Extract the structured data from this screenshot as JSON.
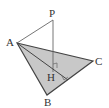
{
  "diagram": {
    "type": "geometry-pyramid",
    "points": {
      "P": {
        "label": "P",
        "x": 53,
        "y": 20
      },
      "A": {
        "label": "A",
        "x": 17,
        "y": 43
      },
      "B": {
        "label": "B",
        "x": 47,
        "y": 95
      },
      "C": {
        "label": "C",
        "x": 93,
        "y": 61
      },
      "H": {
        "label": "H",
        "x": 53,
        "y": 72
      },
      "D": {
        "x": 68,
        "y": 80
      }
    },
    "labels": {
      "P": "P",
      "A": "A",
      "B": "B",
      "C": "C",
      "H": "H"
    },
    "colors": {
      "fill": "#c8c8c8",
      "stroke": "#555555",
      "label": "#333333"
    }
  }
}
